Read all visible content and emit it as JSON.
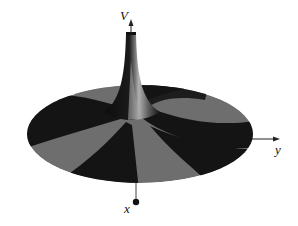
{
  "figure": {
    "axes": {
      "vertical": {
        "label": "V"
      },
      "horizontal_right": {
        "label": "y"
      },
      "toward_viewer": {
        "label": "x"
      }
    },
    "colors": {
      "dark_band": "#141414",
      "light_band": "#6e6e6e",
      "highlight": "#b5b5b5",
      "axis": "#222222",
      "background": "#ffffff"
    }
  }
}
